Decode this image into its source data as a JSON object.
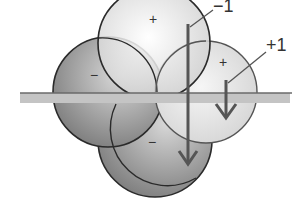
{
  "diagram": {
    "lobes": [
      {
        "id": "top",
        "sign": "+",
        "shade": "light"
      },
      {
        "id": "left",
        "sign": "−",
        "shade": "dark"
      },
      {
        "id": "right",
        "sign": "+",
        "shade": "light"
      },
      {
        "id": "bottom",
        "sign": "−",
        "shade": "dark"
      }
    ],
    "arrows": [
      {
        "label": "−1",
        "length": "long"
      },
      {
        "label": "+1",
        "length": "short"
      }
    ],
    "colors": {
      "outline": "#2a2a2a",
      "plane": "#bdbdbd",
      "arrow": "#555555",
      "light_lobe": "#ececec",
      "dark_lobe": "#9a9a9a"
    }
  }
}
